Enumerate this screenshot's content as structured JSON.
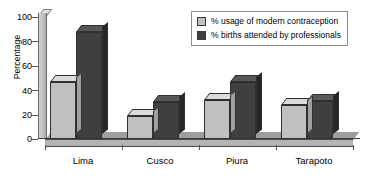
{
  "chart_data": {
    "type": "bar",
    "title": "",
    "subtitle": "",
    "xlabel": "",
    "ylabel": "Percentage",
    "ylim": [
      0,
      100
    ],
    "yticks": [
      0,
      20,
      40,
      60,
      80,
      100
    ],
    "ytick_labels": [
      "0",
      "20",
      "40",
      "60",
      "80",
      "100"
    ],
    "grid": false,
    "legend_position": "top-right",
    "style": "3d-bar",
    "categories": [
      "Lima",
      "Cusco",
      "Piura",
      "Tarapoto"
    ],
    "series": [
      {
        "name": "% usage of modern contraception",
        "color": "#c0c0c0",
        "values": [
          47,
          19,
          32,
          28
        ]
      },
      {
        "name": "% births attended by professionals",
        "color": "#3f3f3f",
        "values": [
          88,
          30,
          47,
          31
        ]
      }
    ]
  },
  "legend": {
    "items": [
      {
        "label": "% usage of modern contraception",
        "swatch": "#c0c0c0"
      },
      {
        "label": "% births attended by professionals",
        "swatch": "#3f3f3f"
      }
    ]
  },
  "axes": {
    "y_title": "Percentage",
    "y_labels": [
      "100",
      "80",
      "60",
      "40",
      "20",
      "0"
    ],
    "x_labels": [
      "Lima",
      "Cusco",
      "Piura",
      "Tarapoto"
    ]
  },
  "colors": {
    "series_light": "#c0c0c0",
    "series_dark": "#3f3f3f",
    "axis": "#4a4a4a",
    "floor": "#b4b4b4",
    "background": "#ffffff"
  }
}
